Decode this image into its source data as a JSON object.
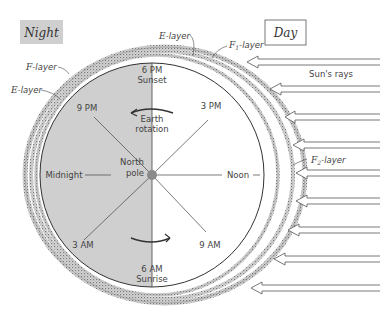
{
  "figure": {
    "night_label": "Night",
    "day_label": "Day",
    "layers": {
      "f_layer_night": {
        "prefix": "F",
        "suffix": "-layer"
      },
      "e_layer_night": {
        "prefix": "E",
        "suffix": "-layer"
      },
      "e_layer_top": {
        "prefix": "E",
        "suffix": "-layer"
      },
      "f1_layer": {
        "prefix": "F",
        "sub": "1",
        "suffix": "-layer"
      },
      "f2_layer": {
        "prefix": "F",
        "sub": "2",
        "suffix": "-layer"
      }
    },
    "sun_rays_label": "Sun's rays",
    "times": {
      "six_pm": "6 PM",
      "sunset": "Sunset",
      "nine_pm": "9 PM",
      "three_pm": "3 PM",
      "midnight": "Midnight",
      "noon": "Noon",
      "three_am": "3 AM",
      "nine_am": "9 AM",
      "six_am": "6 AM",
      "sunrise": "Sunrise"
    },
    "earth_rotation": {
      "line1": "Earth",
      "line2": "rotation"
    },
    "north_pole": {
      "line1": "North",
      "line2": "pole"
    },
    "colors": {
      "night_fill": "#cfcfcf",
      "day_fill": "#ffffff",
      "layer_stipple": "#9a9a9a",
      "line": "#333333"
    },
    "ray_count": 9
  }
}
